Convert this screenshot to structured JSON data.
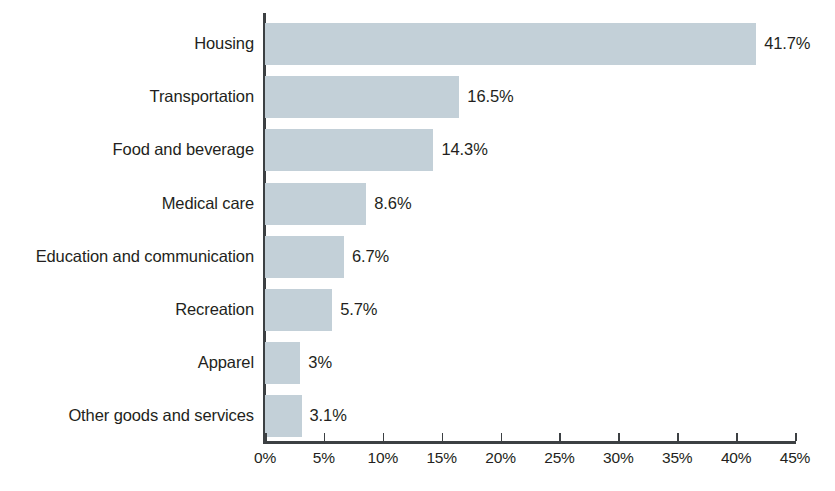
{
  "chart_data": {
    "type": "bar",
    "orientation": "horizontal",
    "title": "",
    "subtitle": "",
    "xlabel": "",
    "ylabel": "",
    "categories": [
      "Housing",
      "Transportation",
      "Food and beverage",
      "Medical care",
      "Education and communication",
      "Recreation",
      "Apparel",
      "Other goods and services"
    ],
    "values": [
      41.7,
      16.5,
      14.3,
      8.6,
      6.7,
      5.7,
      3,
      3.1
    ],
    "data_labels": [
      "41.7%",
      "16.5%",
      "14.3%",
      "8.6%",
      "6.7%",
      "5.7%",
      "3%",
      "3.1%"
    ],
    "xlim": [
      0,
      45
    ],
    "xticks": [
      0,
      5,
      10,
      15,
      20,
      25,
      30,
      35,
      40,
      45
    ],
    "xtick_labels": [
      "0%",
      "5%",
      "10%",
      "15%",
      "20%",
      "25%",
      "30%",
      "35%",
      "40%",
      "45%"
    ],
    "grid": false,
    "legend": null,
    "bar_color": "#c3d0d8",
    "axis_color": "#3c4043",
    "text_color": "#231f20"
  }
}
